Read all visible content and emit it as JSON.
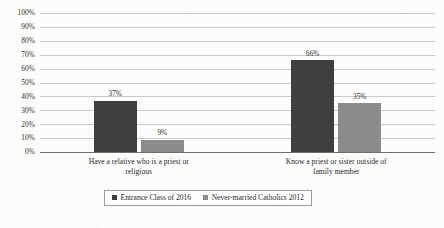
{
  "chart_data": {
    "type": "bar",
    "title": "",
    "subtitle": "",
    "xlabel": "",
    "ylabel": "",
    "ylim": [
      0,
      100
    ],
    "ytick_labels": [
      "100%",
      "90%",
      "80%",
      "70%",
      "60%",
      "50%",
      "40%",
      "30%",
      "20%",
      "10%",
      "0%"
    ],
    "ytick_values": [
      100,
      90,
      80,
      70,
      60,
      50,
      40,
      30,
      20,
      10,
      0
    ],
    "grid": true,
    "legend_position": "bottom-center",
    "value_label_suffix": "%",
    "categories": [
      "Have a relative who is a priest or religious",
      "Know a priest or sister outside of family member"
    ],
    "category_lines": [
      [
        "Have a relative who is a priest or",
        "religious"
      ],
      [
        "Know a priest or sister outside of",
        "family member"
      ]
    ],
    "series": [
      {
        "name": "Entrance Class of 2016",
        "color": "#3f3f3f",
        "values": [
          37,
          66
        ],
        "value_labels": [
          "37%",
          "66%"
        ]
      },
      {
        "name": "Never-married Catholics 2012",
        "color": "#8c8c8c",
        "values": [
          9,
          35
        ],
        "value_labels": [
          "9%",
          "35%"
        ]
      }
    ]
  },
  "colors": {
    "series_dark": "#3f3f3f",
    "series_light": "#8c8c8c",
    "gridline": "#c9c9c9",
    "axis": "#6f6f6f",
    "text": "#2b2b2b",
    "background": "#fdfdfc"
  }
}
